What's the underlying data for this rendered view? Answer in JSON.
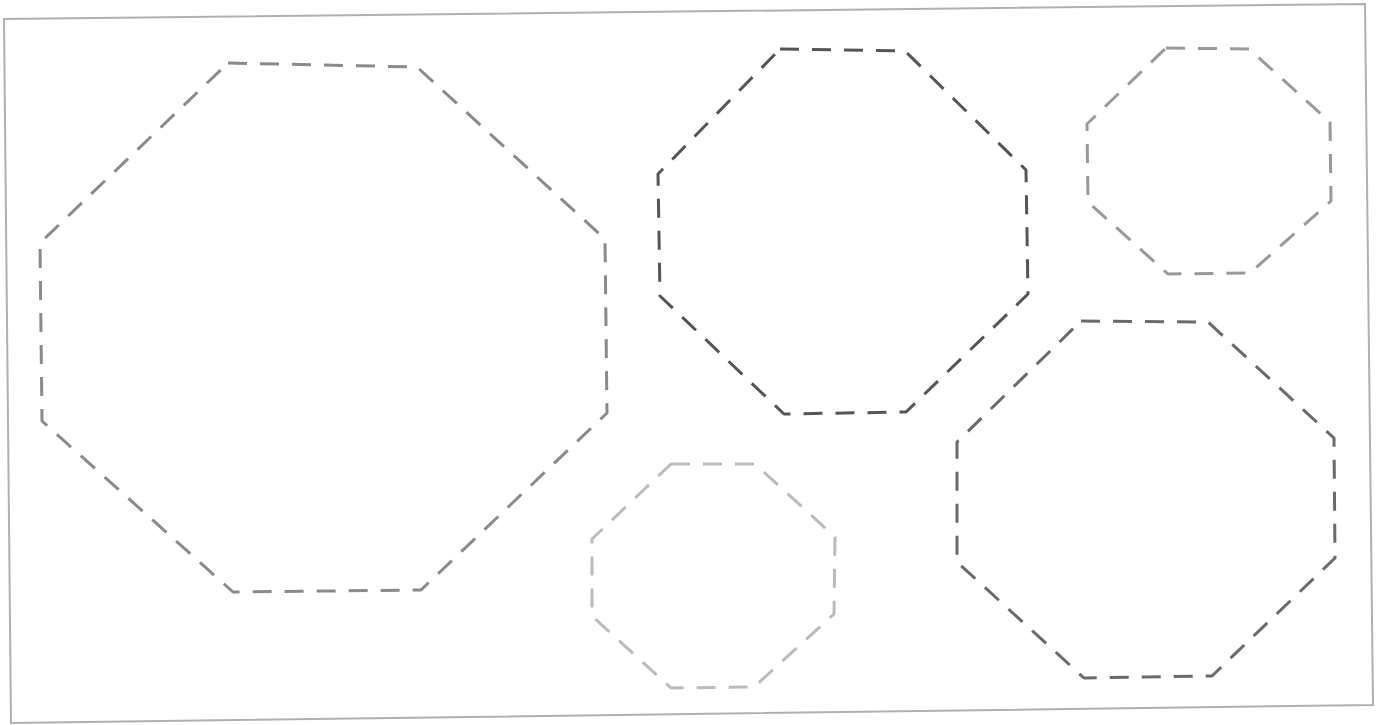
{
  "canvas": {
    "width": 1383,
    "height": 725,
    "background": "#ffffff"
  },
  "frame": {
    "points": [
      [
        4,
        19
      ],
      [
        1365,
        4
      ],
      [
        1373,
        705
      ],
      [
        11,
        723
      ]
    ],
    "stroke": "#b0b0b0",
    "stroke_width": 2
  },
  "shapes": [
    {
      "id": "octagon-large-left",
      "type": "octagon",
      "stroke": "#8a8a8a",
      "points": [
        [
          228,
          63
        ],
        [
          417,
          67
        ],
        [
          605,
          239
        ],
        [
          607,
          413
        ],
        [
          421,
          590
        ],
        [
          233,
          592
        ],
        [
          42,
          421
        ],
        [
          40,
          243
        ]
      ]
    },
    {
      "id": "octagon-top-middle",
      "type": "octagon",
      "stroke": "#555555",
      "points": [
        [
          780,
          49
        ],
        [
          905,
          51
        ],
        [
          1026,
          170
        ],
        [
          1028,
          294
        ],
        [
          906,
          412
        ],
        [
          784,
          414
        ],
        [
          660,
          296
        ],
        [
          658,
          174
        ]
      ]
    },
    {
      "id": "octagon-top-right-small",
      "type": "octagon",
      "stroke": "#999999",
      "points": [
        [
          1166,
          48
        ],
        [
          1249,
          49
        ],
        [
          1330,
          122
        ],
        [
          1331,
          201
        ],
        [
          1250,
          273
        ],
        [
          1168,
          274
        ],
        [
          1088,
          202
        ],
        [
          1087,
          124
        ]
      ]
    },
    {
      "id": "octagon-bottom-middle-small",
      "type": "octagon",
      "stroke": "#bbbbbb",
      "points": [
        [
          671,
          464
        ],
        [
          755,
          464
        ],
        [
          835,
          537
        ],
        [
          834,
          614
        ],
        [
          754,
          687
        ],
        [
          671,
          688
        ],
        [
          592,
          616
        ],
        [
          592,
          539
        ]
      ]
    },
    {
      "id": "octagon-bottom-right",
      "type": "octagon",
      "stroke": "#6a6a6a",
      "points": [
        [
          1081,
          321
        ],
        [
          1208,
          322
        ],
        [
          1334,
          438
        ],
        [
          1335,
          558
        ],
        [
          1212,
          676
        ],
        [
          1084,
          678
        ],
        [
          957,
          562
        ],
        [
          957,
          442
        ]
      ]
    }
  ],
  "dash": {
    "pattern": "19 13",
    "stroke_width": 3
  }
}
